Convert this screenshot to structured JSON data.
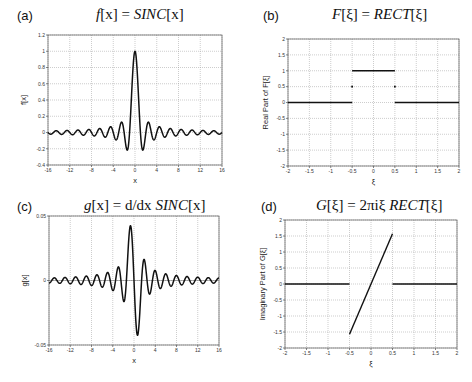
{
  "panels": [
    {
      "label": "(a)",
      "title_pre": "f",
      "title_mid": "[x] = ",
      "title_fn": "SINC",
      "title_post": "[x]"
    },
    {
      "label": "(b)",
      "title_pre": "F",
      "title_mid": "[ξ] = ",
      "title_fn": "RECT",
      "title_post": "[ξ]"
    },
    {
      "label": "(c)",
      "title_pre": "g",
      "title_mid": "[x] = d/dx ",
      "title_fn": "SINC",
      "title_post": "[x]"
    },
    {
      "label": "(d)",
      "title_pre": "G",
      "title_mid": "[ξ] = 2πiξ ",
      "title_fn": "RECT",
      "title_post": "[ξ]"
    }
  ],
  "chart_data": [
    {
      "id": "a",
      "type": "line",
      "title": "f[x] = SINC[x]",
      "xlabel": "x",
      "ylabel": "f[x]",
      "xlim": [
        -16,
        16
      ],
      "ylim": [
        -0.4,
        1.2
      ],
      "xticks": [
        -16,
        -12,
        -8,
        -4,
        0,
        4,
        8,
        12,
        16
      ],
      "yticks": [
        -0.4,
        -0.2,
        0,
        0.2,
        0.4,
        0.6,
        0.8,
        1,
        1.2
      ],
      "grid": true,
      "function": "sin(pi x)/(pi x)",
      "x": [
        -16,
        -14.5,
        -12.5,
        -10.5,
        -8.5,
        -6.5,
        -4.5,
        -3.5,
        -2.46,
        -1.43,
        0,
        1.43,
        2.46,
        3.5,
        4.5,
        6.5,
        8.5,
        10.5,
        12.5,
        14.5,
        16
      ],
      "y": [
        0,
        0.022,
        0.025,
        0.03,
        0.037,
        0.049,
        0.071,
        -0.091,
        0.128,
        -0.217,
        1,
        -0.217,
        0.128,
        -0.091,
        0.071,
        0.049,
        0.037,
        0.03,
        0.025,
        0.022,
        0
      ]
    },
    {
      "id": "b",
      "type": "line",
      "title": "F[ξ] = RECT[ξ]",
      "xlabel": "ξ",
      "ylabel": "Real Part of F[ξ]",
      "xlim": [
        -2,
        2
      ],
      "ylim": [
        -2,
        2
      ],
      "xticks": [
        -2,
        -1.5,
        -1,
        -0.5,
        0,
        0.5,
        1,
        1.5,
        2
      ],
      "yticks": [
        -2,
        -1.5,
        -1,
        -0.5,
        0,
        0.5,
        1,
        1.5,
        2
      ],
      "grid": true,
      "segments": [
        {
          "x": [
            -2,
            -0.5
          ],
          "y": [
            0,
            0
          ]
        },
        {
          "x": [
            -0.5,
            0.5
          ],
          "y": [
            1,
            1
          ]
        },
        {
          "x": [
            0.5,
            2
          ],
          "y": [
            0,
            0
          ]
        }
      ],
      "points": [
        {
          "x": -0.5,
          "y": 0.5
        },
        {
          "x": 0.5,
          "y": 0.5
        }
      ]
    },
    {
      "id": "c",
      "type": "line",
      "title": "g[x] = d/dx SINC[x]",
      "xlabel": "x",
      "ylabel": "g[x]",
      "xlim": [
        -16,
        16
      ],
      "ylim": [
        -0.05,
        0.05
      ],
      "xticks": [
        -16,
        -12,
        -8,
        -4,
        0,
        4,
        8,
        12,
        16
      ],
      "yticks": [
        -0.05,
        0,
        0.05
      ],
      "grid": true,
      "function": "scaled derivative of sin(pi x)/(pi x)",
      "scale": 0.031,
      "x": [
        -3.47,
        -2.5,
        -1.5,
        -0.66,
        0,
        0.66,
        1.5,
        2.5,
        3.47
      ],
      "y": [
        0.02,
        -0.028,
        0.035,
        0.042,
        0,
        -0.042,
        -0.035,
        0.028,
        -0.02
      ]
    },
    {
      "id": "d",
      "type": "line",
      "title": "G[ξ] = 2πiξ RECT[ξ]",
      "xlabel": "ξ",
      "ylabel": "Imaginary Part of G[ξ]",
      "xlim": [
        -2,
        2
      ],
      "ylim": [
        -2,
        2
      ],
      "xticks": [
        -2,
        -1.5,
        -1,
        -0.5,
        0,
        0.5,
        1,
        1.5,
        2
      ],
      "yticks": [
        -2,
        -1.5,
        -1,
        -0.5,
        0,
        0.5,
        1,
        1.5,
        2
      ],
      "grid": true,
      "segments": [
        {
          "x": [
            -2,
            -0.5
          ],
          "y": [
            0,
            0
          ]
        },
        {
          "x": [
            -0.5,
            0.5
          ],
          "y": [
            -1.571,
            1.571
          ]
        },
        {
          "x": [
            0.5,
            2
          ],
          "y": [
            0,
            0
          ]
        }
      ]
    }
  ]
}
